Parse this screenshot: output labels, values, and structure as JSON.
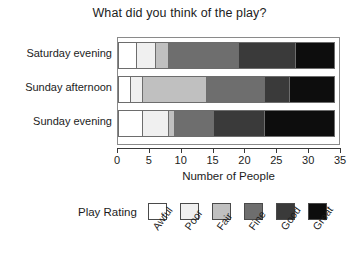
{
  "chart_data": {
    "type": "bar",
    "orientation": "horizontal",
    "stacked": true,
    "title": "What did you think of the play?",
    "xlabel": "Number of People",
    "ylabel": "",
    "xlim": [
      0,
      35
    ],
    "xticks": [
      0,
      5,
      10,
      15,
      20,
      25,
      30,
      35
    ],
    "xtick_labels": [
      "0",
      "5",
      "10",
      "15",
      "20",
      "25",
      "30",
      "35"
    ],
    "grid": false,
    "legend_title": "Play Rating",
    "legend_position": "bottom",
    "categories": [
      "Saturday evening",
      "Sunday afternoon",
      "Sunday evening"
    ],
    "series": [
      {
        "name": "Awful",
        "color": "#ffffff",
        "values": [
          3,
          2,
          4
        ]
      },
      {
        "name": "Poor",
        "color": "#f0f0f0",
        "values": [
          3,
          2,
          4
        ]
      },
      {
        "name": "Fair",
        "color": "#c0c0c0",
        "values": [
          2,
          10,
          1
        ]
      },
      {
        "name": "Fine",
        "color": "#6e6e6e",
        "values": [
          11,
          9,
          6
        ]
      },
      {
        "name": "Good",
        "color": "#3a3a3a",
        "values": [
          9,
          4,
          8
        ]
      },
      {
        "name": "Great",
        "color": "#0d0d0d",
        "values": [
          6,
          7,
          11
        ]
      }
    ],
    "row_totals": [
      34,
      34,
      34
    ]
  },
  "colors": {
    "axis": "#3a3a3a",
    "plot_border": "#8a8a8a",
    "text": "#1c1c1c",
    "background": "#ffffff"
  }
}
